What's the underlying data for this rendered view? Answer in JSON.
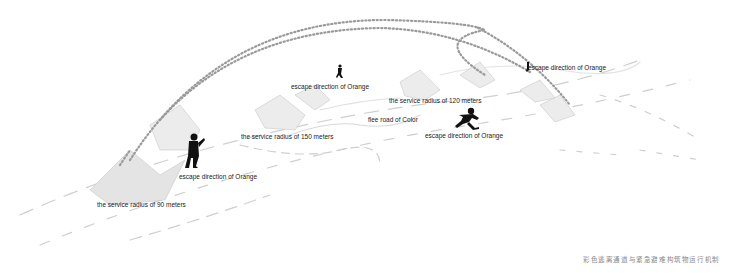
{
  "diagram": {
    "labels": {
      "escape_1": "escape direction of Orange",
      "escape_2": "escape direction of Orange",
      "escape_3": "escape direction of Orange",
      "escape_4": "escape direction of Orange",
      "radius_90": "the service radius of 90 meters",
      "radius_120": "the service radius of 120 meters",
      "radius_150": "the service radius of 150 meters",
      "flee_road": "flee road of Color"
    },
    "caption": "彩色逃离通道与紧急避难构筑物运行机制",
    "colors": {
      "background": "#ffffff",
      "text": "#222222",
      "dotted_path": "#999999",
      "terrain": "#cccccc",
      "figure": "#111111"
    }
  }
}
